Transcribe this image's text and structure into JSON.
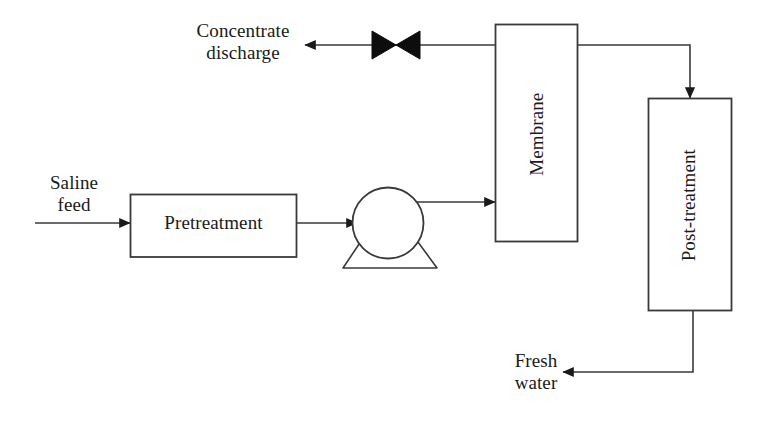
{
  "diagram": {
    "background_color": "#ffffff",
    "line_color": "#3a3a3a",
    "text_color": "#1a1a1a",
    "nodes": {
      "pretreatment": {
        "label": "Pretreatment",
        "shape": "rectangle"
      },
      "pump": {
        "label": "",
        "shape": "pump-circle-on-base"
      },
      "membrane": {
        "label": "Membrane",
        "shape": "rectangle",
        "orientation": "vertical"
      },
      "post_treatment": {
        "label": "Post-treatment",
        "shape": "rectangle",
        "orientation": "vertical"
      },
      "valve": {
        "label": "",
        "shape": "bowtie-valve"
      }
    },
    "stream_labels": {
      "saline_feed_line1": "Saline",
      "saline_feed_line2": "feed",
      "concentrate_line1": "Concentrate",
      "concentrate_line2": "discharge",
      "fresh_water_line1": "Fresh",
      "fresh_water_line2": "water"
    },
    "flows": [
      {
        "from": "saline feed",
        "to": "Pretreatment",
        "direction": "right"
      },
      {
        "from": "Pretreatment",
        "to": "pump",
        "direction": "right"
      },
      {
        "from": "pump",
        "to": "Membrane",
        "direction": "right"
      },
      {
        "from": "Membrane",
        "to": "concentrate discharge",
        "direction": "left",
        "via": "valve"
      },
      {
        "from": "Membrane",
        "to": "Post-treatment",
        "direction": "down"
      },
      {
        "from": "Post-treatment",
        "to": "fresh water",
        "direction": "left"
      }
    ]
  }
}
